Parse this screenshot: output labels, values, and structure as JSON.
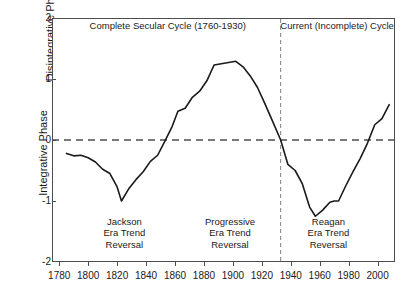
{
  "chart_data": {
    "type": "line",
    "title": "",
    "xlabel": "",
    "ylabel_top": "Disintegrative Phase",
    "ylabel_bottom": "Integrative Phase",
    "xlim": [
      1775,
      2012
    ],
    "ylim": [
      -2,
      2
    ],
    "grid": false,
    "legend": "none",
    "xticks": [
      1780,
      1800,
      1820,
      1840,
      1860,
      1880,
      1900,
      1920,
      1940,
      1960,
      1980,
      2000
    ],
    "yticks": [
      2,
      1,
      0,
      -1,
      -2
    ],
    "zero_line": 0,
    "divider_x": 1933,
    "series": [
      {
        "name": "Political stress / secular cycle index",
        "x": [
          1785,
          1790,
          1795,
          1800,
          1805,
          1810,
          1815,
          1820,
          1823,
          1828,
          1833,
          1838,
          1843,
          1848,
          1853,
          1858,
          1862,
          1867,
          1872,
          1877,
          1882,
          1887,
          1892,
          1897,
          1902,
          1907,
          1912,
          1917,
          1922,
          1927,
          1933,
          1938,
          1943,
          1948,
          1953,
          1957,
          1962,
          1967,
          1970,
          1973,
          1978,
          1983,
          1988,
          1993,
          1998,
          2003,
          2008
        ],
        "y": [
          -0.22,
          -0.26,
          -0.25,
          -0.29,
          -0.36,
          -0.48,
          -0.55,
          -0.77,
          -1.0,
          -0.8,
          -0.65,
          -0.52,
          -0.35,
          -0.25,
          -0.02,
          0.22,
          0.47,
          0.52,
          0.7,
          0.8,
          0.97,
          1.23,
          1.25,
          1.27,
          1.29,
          1.2,
          1.05,
          0.86,
          0.6,
          0.33,
          0.0,
          -0.4,
          -0.5,
          -0.72,
          -1.1,
          -1.25,
          -1.15,
          -1.02,
          -1.0,
          -1.0,
          -0.75,
          -0.52,
          -0.3,
          -0.05,
          0.25,
          0.35,
          0.58
        ]
      }
    ],
    "annotations": [
      {
        "id": "complete-cycle",
        "text": "Complete Secular Cycle (1760-1930)",
        "x": 1855,
        "y": 1.87
      },
      {
        "id": "current-cycle",
        "text": "Current (Incomplete) Cycle",
        "x": 1972,
        "y": 1.87
      },
      {
        "id": "jackson-reversal",
        "lines": [
          "Jackson",
          "Era Trend",
          "Reversal"
        ],
        "x": 1825,
        "y": -1.52
      },
      {
        "id": "progressive-reversal",
        "lines": [
          "Progressive",
          "Era Trend",
          "Reversal"
        ],
        "x": 1898,
        "y": -1.52
      },
      {
        "id": "reagan-reversal",
        "lines": [
          "Reagan",
          "Era Trend",
          "Reversal"
        ],
        "x": 1966,
        "y": -1.52
      }
    ]
  },
  "colors": {
    "line": "#1a1a1a",
    "axis": "#4d4d4d",
    "zero_dash": "#4d4d4d",
    "divider_dash": "#808080",
    "background": "#ffffff",
    "text": "#1a1a1a"
  },
  "axis": {
    "ytick_labels": [
      "2",
      "1",
      "0",
      "-1",
      "-2"
    ],
    "xtick_labels": [
      "1780",
      "1800",
      "1820",
      "1840",
      "1860",
      "1880",
      "1900",
      "1920",
      "1940",
      "1960",
      "1980",
      "2000"
    ]
  },
  "annotations_text": {
    "complete_cycle": "Complete Secular Cycle (1760-1930)",
    "current_cycle": "Current (Incomplete) Cycle",
    "jackson_1": "Jackson",
    "jackson_2": "Era Trend",
    "jackson_3": "Reversal",
    "progressive_1": "Progressive",
    "progressive_2": "Era Trend",
    "progressive_3": "Reversal",
    "reagan_1": "Reagan",
    "reagan_2": "Era Trend",
    "reagan_3": "Reversal"
  }
}
